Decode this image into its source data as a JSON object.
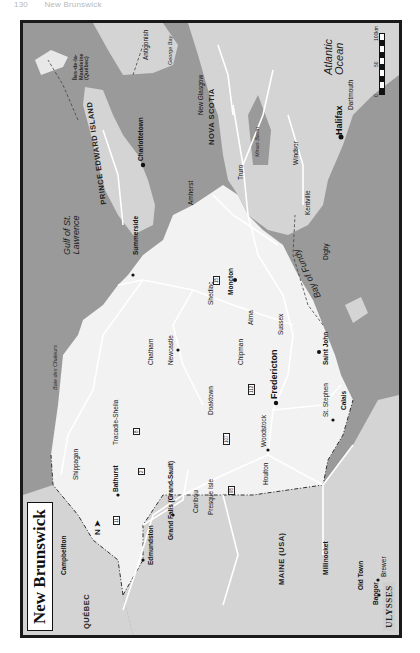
{
  "page": {
    "number": "130",
    "chapter": "New Brunswick"
  },
  "map": {
    "title": "New Brunswick",
    "north_label": "N",
    "scale": {
      "ticks": [
        "0",
        "50",
        "100km"
      ]
    },
    "publisher_logo": "ULYSSES",
    "colors": {
      "water": "#9a9a9a",
      "land_nb": "#f2f2f2",
      "land_other": "#d4d4d4",
      "roads": "#ffffff",
      "border": "#1a1a1a"
    },
    "regions": {
      "quebec": "QUÉBEC",
      "maine": "MAINE (USA)",
      "pei": "PRINCE EDWARD ISLAND",
      "nova_scotia": "NOVA SCOTIA",
      "madeleine": "Îles-de-la-Madeleine (Québec)"
    },
    "waters": {
      "gulf": "Gulf of St. Lawrence",
      "atlantic": "Atlantic Ocean",
      "fundy": "Bay of Fundy",
      "minas": "Minas Basin",
      "george_bay": "George Bay",
      "northumberland": "Pictou Island",
      "chaleur": "Baie des Chaleurs",
      "minas_channel": "Minas Channel"
    },
    "places": {
      "fredericton": "Fredericton",
      "saint_john": "Saint John",
      "moncton": "Moncton",
      "halifax": "Halifax",
      "charlottetown": "Charlottetown",
      "bathurst": "Bathurst",
      "campbellton": "Campbellton",
      "edmundston": "Edmundston",
      "grand_falls": "Grand Falls (Grand-Sault)",
      "woodstock": "Woodstock",
      "st_stephen": "St. Stephen",
      "calais": "Calais",
      "bangor": "Bangor",
      "brewer": "Brewer",
      "old_town": "Old Town",
      "millinocket": "Millinocket",
      "houlton": "Houlton",
      "presque_isle": "Presque Isle",
      "caribou": "Caribou",
      "limestone": "Limestone",
      "van_buren": "Van Buren",
      "fort_kent": "Fort Kent",
      "eagle_lake": "Eagle Lake",
      "st_jacques": "St. Jacques",
      "degelis": "Dégelis",
      "cabano": "Cabano",
      "nd_du_lac": "N.-D.-du-Lac",
      "st_francois": "Saint-François",
      "st_basile": "St. Basile",
      "st_leonard": "St. Leonard",
      "saint_quentin": "Saint-Quentin",
      "kedgwick": "Kedgwick",
      "matapedia": "Matapédia",
      "dalhousie": "Dalhousie",
      "new_carlisle": "New Carlisle",
      "maisonnette": "Maisonnette",
      "grande_anse": "Grande-Anse",
      "caraquet": "Caraquet",
      "lameque": "Lamèque Island",
      "shippagan": "Shippagan",
      "tracadie": "Tracadie-Sheila",
      "neguac": "Neguac",
      "burnt_church": "Bartibog Bridge",
      "escuminac": "Escuminac",
      "kouchibouguac": "Kouchibouguac National Park",
      "richibucto": "Richibucto",
      "rexton": "Rexton",
      "bouctouche": "Bouctouche",
      "shediac": "Shediac",
      "dieppe": "Dieppe",
      "riverview": "Riverview",
      "sackville": "Sackville",
      "amherst": "Amherst",
      "hopewell_cape": "Hopewell Cape",
      "alma": "Alma",
      "fundy_park": "Fundy National Park",
      "sussex": "Sussex",
      "st_martins": "St. Martins",
      "chatham": "Chatham",
      "chatham_head": "Chatham Head",
      "newcastle": "Newcastle",
      "doaktown": "Doaktown",
      "boiestown": "Boiestown",
      "chipman": "Chipman",
      "minto": "Minto",
      "mactaquac": "Mactaquac",
      "marysville": "Marysville",
      "oromocto": "Oromocto",
      "gagetown": "Gagetown",
      "tracy": "Tracy",
      "mcadam": "McAdam",
      "prince_william": "Prince William",
      "nackawic": "Nackawic",
      "hartland": "Hartland",
      "florenceville": "Florenceville",
      "bath": "Bath",
      "plaster_rock": "Plaster Rock",
      "new_denmark": "New Denmark",
      "beechwood": "Beechwood",
      "mount_carleton": "Mount Carleton 820m",
      "mount_carleton_park": "Mount-Carleton Provincial Park",
      "nictau": "Nictau",
      "tetagouche_falls": "Tetagouche Falls",
      "st_george": "St. George",
      "st_andrews": "St. Andrews-by-the-Sea",
      "deer_island": "Deer Island",
      "campobello": "Campobello Island",
      "grand_manan": "Grand Manan Island",
      "north_head": "North Head",
      "seal_cove": "Seal Cove",
      "white_head": "White Head Island",
      "eastport": "Eastport",
      "lubec": "Lubec",
      "east_machias": "East Machias",
      "machias": "Machias",
      "cherryfield": "Cherryfield",
      "wesley": "Wesley",
      "lincoln": "Lincoln",
      "patten": "Patten",
      "sherman": "Sherman",
      "summerside": "Summerside",
      "borden": "Borden",
      "cap_pele": "Cap Pelé",
      "cape_tormentine": "Cape Tormentine",
      "port_elgin": "Port Elgin",
      "baie_verte": "Baie Verte",
      "cavendish": "Cavendish",
      "park_corner": "Park Corner",
      "alberton": "Alberton",
      "north_cape": "North Cape",
      "tignish": "Tignish",
      "west_point": "West Point",
      "montague": "Montague",
      "souris": "Souris",
      "east_point": "East Point",
      "inverness": "Inverness",
      "port_hastings": "Port Hastings",
      "mulgrave": "Mulgrave",
      "antigonish": "Antigonish",
      "pictou": "Pictou",
      "stellarton": "Stellarton",
      "new_glasgow": "New Glasgow",
      "truro": "Truro",
      "stewiacke": "Stewiacke",
      "springhill": "Springhill",
      "parrsboro": "Parrsboro",
      "wolfville": "Wolfville",
      "kentville": "Kentville",
      "berwick": "Berwick",
      "windsor": "Windsor",
      "waterville": "Waterville",
      "kingston": "Kingston",
      "middleton": "Middleton",
      "bridgetown": "Bridgetown",
      "annapolis_royal": "Annapolis Royal",
      "port_royal": "Port Royal",
      "digby": "Digby",
      "dartmouth": "Dartmouth",
      "chester": "Chester",
      "sheet_harbour": "Sheet Harbour",
      "liscomb": "Liscomb",
      "ile_brion": "Île Brion",
      "grande_entree": "Grande-Entrée",
      "cap_aux_meules": "Cap-aux-Meules",
      "ile_entree": "L'Île-d'Entrée",
      "letang": "L'Étang-du-Nord",
      "havre_aubert": "Havre-Aubert"
    },
    "route_shields": [
      "2",
      "8",
      "11",
      "15",
      "17",
      "95",
      "101",
      "104",
      "107",
      "108",
      "112",
      "116",
      "126",
      "134",
      "1",
      "3",
      "4",
      "7",
      "114",
      "6"
    ]
  }
}
